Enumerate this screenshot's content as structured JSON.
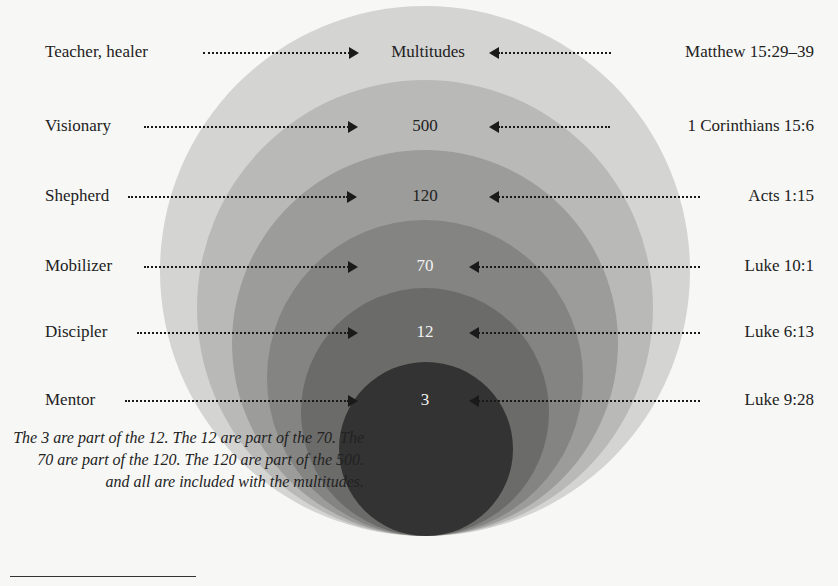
{
  "diagram": {
    "type": "nested-concentric-circles",
    "colors": {
      "background": "#f7f7f5",
      "circle_multitudes": "#d4d4d2",
      "circle_500": "#b9b9b7",
      "circle_120": "#9c9c9a",
      "circle_70": "#848482",
      "circle_12": "#6b6b69",
      "circle_3": "#333333",
      "arrow": "#1a1a1a"
    },
    "rows": [
      {
        "role": "Teacher, healer",
        "group": "Multitudes",
        "reference": "Matthew 15:29–39"
      },
      {
        "role": "Visionary",
        "group": "500",
        "reference": "1 Corinthians 15:6"
      },
      {
        "role": "Shepherd",
        "group": "120",
        "reference": "Acts 1:15"
      },
      {
        "role": "Mobilizer",
        "group": "70",
        "reference": "Luke 10:1"
      },
      {
        "role": "Discipler",
        "group": "12",
        "reference": "Luke 6:13"
      },
      {
        "role": "Mentor",
        "group": "3",
        "reference": "Luke 9:28"
      }
    ],
    "note": "The 3 are part of the 12. The 12 are part of the 70. The 70 are part of the 120. The 120 are part of the 500. and all are included with the multitudes."
  }
}
